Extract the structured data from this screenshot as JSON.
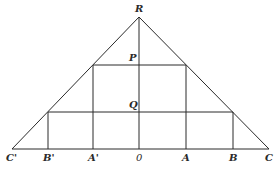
{
  "diagram": {
    "type": "geometric-construction",
    "stroke_color": "#2a2a2a",
    "background": "#ffffff",
    "points": {
      "R": {
        "label": "R",
        "x": 139,
        "y": 17
      },
      "P": {
        "label": "P",
        "x": 139,
        "y": 65
      },
      "Q": {
        "label": "Q",
        "x": 139,
        "y": 112
      },
      "C_prime": {
        "label": "C'",
        "x": 12,
        "y": 149
      },
      "B_prime": {
        "label": "B'",
        "x": 48,
        "y": 149
      },
      "A_prime": {
        "label": "A'",
        "x": 93,
        "y": 149
      },
      "O": {
        "label": "0",
        "x": 139,
        "y": 149
      },
      "A": {
        "label": "A",
        "x": 186,
        "y": 149
      },
      "B": {
        "label": "B",
        "x": 233,
        "y": 149
      },
      "C": {
        "label": "C",
        "x": 269,
        "y": 149
      }
    },
    "labels": {
      "R": "R",
      "P": "P",
      "Q": "Q",
      "C_prime": "C'",
      "B_prime": "B'",
      "A_prime": "A'",
      "O": "0",
      "A": "A",
      "B": "B",
      "C": "C"
    },
    "segments": [
      {
        "name": "side-left",
        "from": "C'",
        "to": "R"
      },
      {
        "name": "side-right",
        "from": "R",
        "to": "C"
      },
      {
        "name": "base",
        "from": "C'",
        "to": "C"
      },
      {
        "name": "axis",
        "from": "R",
        "to": "0"
      },
      {
        "name": "chord-P",
        "through": "P",
        "y": 65,
        "x1": 93,
        "x2": 186
      },
      {
        "name": "chord-Q",
        "through": "Q",
        "y": 112,
        "x1": 48,
        "x2": 233
      },
      {
        "name": "vertical-A-prime",
        "x": 93,
        "y1": 65,
        "y2": 149
      },
      {
        "name": "vertical-A",
        "x": 186,
        "y1": 65,
        "y2": 149
      },
      {
        "name": "vertical-B-prime",
        "x": 48,
        "y1": 112,
        "y2": 149
      },
      {
        "name": "vertical-B",
        "x": 233,
        "y1": 112,
        "y2": 149
      }
    ]
  }
}
